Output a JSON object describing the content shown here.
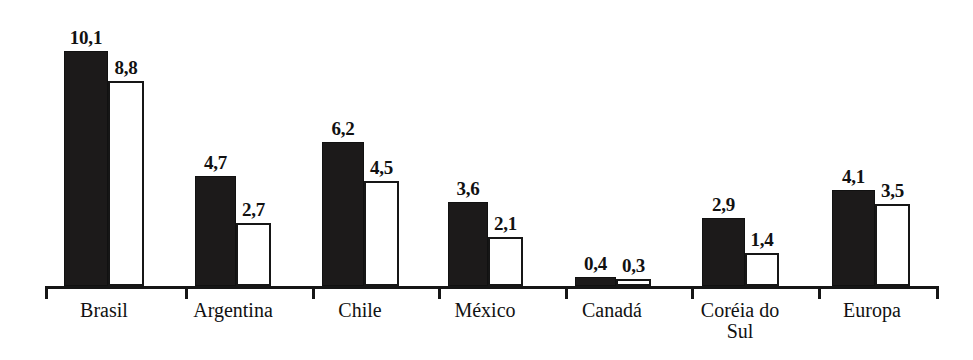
{
  "chart_data": {
    "type": "bar",
    "title": "",
    "subtitle": "",
    "xlabel": "",
    "ylabel": "",
    "grid": false,
    "legend": "none",
    "axis_visible": {
      "x": true,
      "y": false
    },
    "ylim": [
      0,
      10.1
    ],
    "decimal_separator": ",",
    "categories": [
      "Brasil",
      "Argentina",
      "Chile",
      "México",
      "Canadá",
      "Coréia do Sul",
      "Europa"
    ],
    "series": [
      {
        "name": "series-1",
        "style": "filled-dark",
        "color": "#1c1a1a",
        "values": [
          10.1,
          4.7,
          6.2,
          3.6,
          0.4,
          2.9,
          4.1
        ],
        "labels": [
          "10,1",
          "4,7",
          "6,2",
          "3,6",
          "0,4",
          "2,9",
          "4,1"
        ]
      },
      {
        "name": "series-2",
        "style": "outlined-white",
        "color": "#ffffff",
        "border_color": "#161616",
        "values": [
          8.8,
          2.7,
          4.5,
          2.1,
          0.3,
          1.4,
          3.5
        ],
        "labels": [
          "8,8",
          "2,7",
          "4,5",
          "2,1",
          "0,3",
          "1,4",
          "3,5"
        ]
      }
    ]
  },
  "layout": {
    "baseline_y": 286,
    "axis_x_start": 45,
    "axis_x_end": 936,
    "px_per_unit": 23.3,
    "tick_height": 13,
    "tick_positions": [
      45,
      185,
      312,
      438,
      565,
      691,
      818,
      936
    ],
    "groups": [
      {
        "dark_x": 64,
        "dark_w": 44,
        "light_x": 108,
        "light_w": 36,
        "label_cx": 104,
        "label_text": "Brasil"
      },
      {
        "dark_x": 195,
        "dark_w": 41,
        "light_x": 236,
        "light_w": 35,
        "label_cx": 233,
        "label_text": "Argentina"
      },
      {
        "dark_x": 322,
        "dark_w": 42,
        "light_x": 364,
        "light_w": 35,
        "label_cx": 360,
        "label_text": "Chile"
      },
      {
        "dark_x": 448,
        "dark_w": 40,
        "light_x": 488,
        "light_w": 35,
        "label_cx": 485,
        "label_text": "México"
      },
      {
        "dark_x": 575,
        "dark_w": 41,
        "light_x": 616,
        "light_w": 35,
        "label_cx": 612,
        "label_text": "Canadá"
      },
      {
        "dark_x": 702,
        "dark_w": 43,
        "light_x": 745,
        "light_w": 34,
        "label_cx": 740,
        "label_text": "Coréia do\nSul"
      },
      {
        "dark_x": 832,
        "dark_w": 43,
        "light_x": 875,
        "light_w": 35,
        "label_cx": 872,
        "label_text": "Europa"
      }
    ]
  }
}
